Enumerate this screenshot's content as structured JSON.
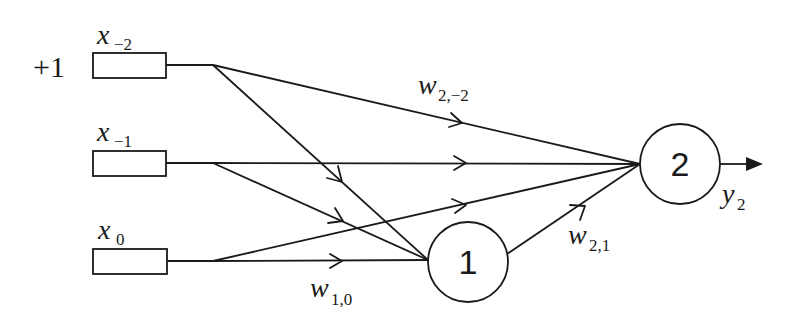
{
  "diagram": {
    "type": "neural-network",
    "bias_label": "+1",
    "inputs": [
      {
        "id": "x_-2",
        "base": "x",
        "sub": "−2",
        "box": {
          "x": 93,
          "y": 53,
          "w": 73,
          "h": 25
        },
        "branch": {
          "x": 213,
          "y": 65
        }
      },
      {
        "id": "x_-1",
        "base": "x",
        "sub": "−1",
        "box": {
          "x": 93,
          "y": 151,
          "w": 73,
          "h": 25
        },
        "branch": {
          "x": 213,
          "y": 163
        }
      },
      {
        "id": "x_0",
        "base": "x",
        "sub": "0",
        "box": {
          "x": 93,
          "y": 249,
          "w": 74,
          "h": 25
        },
        "branch": {
          "x": 213,
          "y": 261
        }
      }
    ],
    "nodes": [
      {
        "id": "1",
        "label": "1",
        "cx": 468,
        "cy": 262,
        "r": 40
      },
      {
        "id": "2",
        "label": "2",
        "cx": 680,
        "cy": 164,
        "r": 40
      }
    ],
    "edges": [
      {
        "from": "x_-2",
        "to": "2"
      },
      {
        "from": "x_-2",
        "to": "1"
      },
      {
        "from": "x_-1",
        "to": "2"
      },
      {
        "from": "x_-1",
        "to": "1"
      },
      {
        "from": "x_0",
        "to": "2"
      },
      {
        "from": "x_0",
        "to": "1"
      },
      {
        "from": "1",
        "to": "2"
      }
    ],
    "weight_labels": [
      {
        "id": "w_2,-2",
        "base": "w",
        "sub": "2,−2",
        "x": 418,
        "y": 94
      },
      {
        "id": "w_1,0",
        "base": "w",
        "sub": "1,0",
        "x": 310,
        "y": 300
      },
      {
        "id": "w_2,1",
        "base": "w",
        "sub": "2,1",
        "x": 568,
        "y": 244
      }
    ],
    "output": {
      "base": "y",
      "sub": "2",
      "label_x": 722,
      "label_y": 207
    }
  }
}
